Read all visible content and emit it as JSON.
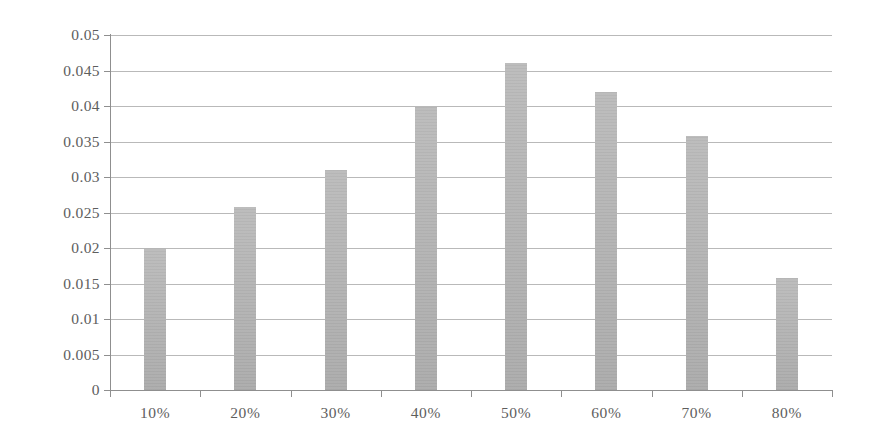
{
  "chart_data": {
    "type": "bar",
    "title": "",
    "subtitle": "",
    "xlabel": "",
    "ylabel": "",
    "categories": [
      "10%",
      "20%",
      "30%",
      "40%",
      "50%",
      "60%",
      "70%",
      "80%"
    ],
    "values": [
      0.02,
      0.0258,
      0.031,
      0.0399,
      0.046,
      0.042,
      0.0358,
      0.0158
    ],
    "series": [
      {
        "name": "",
        "values": [
          0.02,
          0.0258,
          0.031,
          0.0399,
          0.046,
          0.042,
          0.0358,
          0.0158
        ]
      }
    ],
    "ylim": [
      0,
      0.05
    ],
    "ytick_values": [
      0,
      0.005,
      0.01,
      0.015,
      0.02,
      0.025,
      0.03,
      0.035,
      0.04,
      0.045,
      0.05
    ],
    "ytick_labels": [
      "0",
      "0.005",
      "0.01",
      "0.015",
      "0.02",
      "0.025",
      "0.03",
      "0.035",
      "0.04",
      "0.045",
      "0.05"
    ],
    "xtick_labels": [
      "10%",
      "20%",
      "30%",
      "40%",
      "50%",
      "60%",
      "70%",
      "80%"
    ],
    "grid": true,
    "grid_axis": "y",
    "legend": false,
    "legend_position": "none",
    "bar_color": "#b4b4b4",
    "gridline_color": "#b9b9b9",
    "axis_color": "#8f8f8f",
    "tick_label_color": "#5e5e5e",
    "background_color": "#ffffff"
  }
}
